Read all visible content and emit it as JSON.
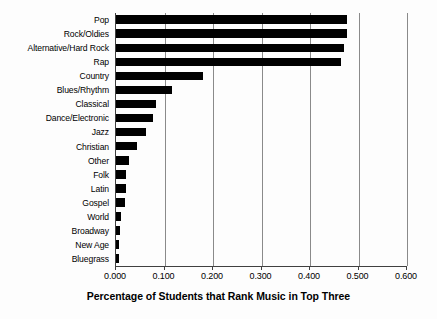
{
  "chart_data": {
    "type": "bar",
    "orientation": "horizontal",
    "title": "",
    "xlabel": "Percentage of Students that Rank Music in Top Three",
    "ylabel": "",
    "xlim": [
      0.0,
      0.6
    ],
    "xticks": [
      "0.000",
      "0.100",
      "0.200",
      "0.300",
      "0.400",
      "0.500",
      "0.600"
    ],
    "xtick_values": [
      0.0,
      0.1,
      0.2,
      0.3,
      0.4,
      0.5,
      0.6
    ],
    "grid": true,
    "grid_axis": "x",
    "legend": false,
    "bar_color": "#000000",
    "categories": [
      "Pop",
      "Rock/Oldies",
      "Alternative/Hard Rock",
      "Rap",
      "Country",
      "Blues/Rhythm",
      "Classical",
      "Dance/Electronic",
      "Jazz",
      "Christian",
      "Other",
      "Folk",
      "Latin",
      "Gospel",
      "World",
      "Broadway",
      "New Age",
      "Bluegrass"
    ],
    "values": [
      0.477,
      0.477,
      0.471,
      0.464,
      0.179,
      0.115,
      0.082,
      0.076,
      0.062,
      0.043,
      0.027,
      0.021,
      0.02,
      0.019,
      0.011,
      0.008,
      0.006,
      0.006
    ]
  }
}
